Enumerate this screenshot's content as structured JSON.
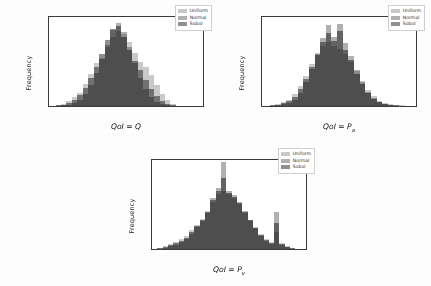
{
  "figure": {
    "background": "#fdfdfd",
    "panel_count": 3,
    "legend_entries": [
      "Uniform",
      "Normal",
      "Sobol"
    ],
    "series_colors": {
      "Uniform": "#c9c9c9",
      "Normal": "#b0b0b0",
      "Sobol": "#8f8f8f"
    },
    "shared_ylabel": "Frequency"
  },
  "chart_data": [
    {
      "id": "panel-1",
      "type": "bar",
      "title": "",
      "xlabel": "QoI = Q",
      "xlabel_base": "QoI = Q",
      "xlabel_sub": "",
      "ylabel": "Frequency",
      "xlim": [
        -37.5,
        187.5
      ],
      "ylim": [
        0,
        145
      ],
      "xticks": [
        -25,
        0,
        25,
        50,
        75,
        100,
        125,
        150,
        175
      ],
      "xticklabels": [
        "-25",
        "0",
        "25",
        "50",
        "75",
        "100",
        "125",
        "150",
        "175"
      ],
      "yticks": [
        0,
        20,
        40,
        60,
        80,
        100,
        120,
        140
      ],
      "yticklabels": [
        "0",
        "20",
        "40",
        "60",
        "80",
        "100",
        "120",
        "140"
      ],
      "grid": false,
      "legend_position": "upper right",
      "bin_width": 8,
      "bin_starts": [
        -28,
        -20,
        -12,
        -4,
        4,
        12,
        20,
        28,
        36,
        44,
        52,
        60,
        68,
        76,
        84,
        92,
        100,
        108,
        116,
        124,
        132,
        140
      ],
      "series": [
        {
          "name": "Uniform",
          "values": [
            2,
            4,
            8,
            14,
            22,
            36,
            52,
            70,
            78,
            96,
            112,
            122,
            118,
            104,
            86,
            72,
            64,
            50,
            34,
            20,
            9,
            3
          ]
        },
        {
          "name": "Normal",
          "values": [
            0,
            1,
            2,
            5,
            10,
            20,
            34,
            54,
            76,
            100,
            124,
            136,
            120,
            96,
            70,
            46,
            28,
            15,
            7,
            3,
            1,
            0
          ]
        },
        {
          "name": "Sobol",
          "values": [
            1,
            2,
            5,
            10,
            18,
            30,
            46,
            64,
            84,
            108,
            126,
            130,
            112,
            92,
            74,
            58,
            42,
            28,
            16,
            8,
            3,
            1
          ]
        }
      ]
    },
    {
      "id": "panel-2",
      "type": "bar",
      "title": "",
      "xlabel": "QoI = Pa",
      "xlabel_base": "QoI = P",
      "xlabel_sub": "a",
      "ylabel": "Frequency",
      "xlim": [
        2.3,
        3.12
      ],
      "ylim": [
        0,
        165
      ],
      "xticks": [
        2.3,
        2.4,
        2.5,
        2.6,
        2.7,
        2.8,
        2.9,
        3.0,
        3.1
      ],
      "xticklabels": [
        "2.3",
        "2.4",
        "2.5",
        "2.6",
        "2.7",
        "2.8",
        "2.9",
        "3.0",
        "3.1"
      ],
      "yticks": [
        0,
        20,
        40,
        60,
        80,
        100,
        120,
        140,
        160
      ],
      "yticklabels": [
        "0",
        "20",
        "40",
        "60",
        "80",
        "100",
        "120",
        "140",
        "160"
      ],
      "grid": false,
      "legend_position": "upper right",
      "bin_width": 0.03,
      "bin_starts": [
        2.34,
        2.37,
        2.4,
        2.43,
        2.46,
        2.49,
        2.52,
        2.55,
        2.58,
        2.61,
        2.64,
        2.67,
        2.7,
        2.73,
        2.76,
        2.79,
        2.82,
        2.85,
        2.88,
        2.91,
        2.94,
        2.97,
        3.0,
        3.03
      ],
      "series": [
        {
          "name": "Uniform",
          "values": [
            2,
            4,
            7,
            12,
            22,
            38,
            56,
            78,
            98,
            112,
            118,
            112,
            106,
            96,
            82,
            64,
            46,
            30,
            18,
            10,
            6,
            3,
            2,
            1
          ]
        },
        {
          "name": "Normal",
          "values": [
            0,
            1,
            3,
            6,
            12,
            24,
            44,
            68,
            96,
            126,
            150,
            128,
            152,
            116,
            92,
            66,
            44,
            26,
            14,
            7,
            3,
            1,
            0,
            0
          ]
        },
        {
          "name": "Sobol",
          "values": [
            1,
            2,
            5,
            9,
            17,
            32,
            50,
            72,
            94,
            118,
            136,
            120,
            140,
            104,
            86,
            60,
            40,
            24,
            13,
            7,
            4,
            2,
            1,
            0
          ]
        }
      ]
    },
    {
      "id": "panel-3",
      "type": "bar",
      "title": "",
      "xlabel": "QoI = Pv",
      "xlabel_base": "QoI = P",
      "xlabel_sub": "v",
      "ylabel": "Frequency",
      "xlim": [
        -1.25,
        1.65
      ],
      "ylim": [
        0,
        182
      ],
      "xticks": [
        -1.0,
        -0.5,
        0.0,
        0.5,
        1.0,
        1.5
      ],
      "xticklabels": [
        "-1.0",
        "-0.5",
        "0.0",
        "0.5",
        "1.0",
        "1.5"
      ],
      "yticks": [
        0,
        25,
        50,
        75,
        100,
        125,
        150,
        175
      ],
      "yticklabels": [
        "0",
        "25",
        "50",
        "75",
        "100",
        "125",
        "150",
        "175"
      ],
      "grid": false,
      "legend_position": "upper right",
      "bin_width": 0.1,
      "bin_starts": [
        -1.15,
        -1.05,
        -0.95,
        -0.85,
        -0.75,
        -0.65,
        -0.55,
        -0.45,
        -0.35,
        -0.25,
        -0.15,
        -0.05,
        0.05,
        0.15,
        0.25,
        0.35,
        0.45,
        0.55,
        0.65,
        0.75,
        0.85,
        0.95,
        1.05,
        1.15,
        1.25,
        1.35
      ],
      "series": [
        {
          "name": "Uniform",
          "values": [
            3,
            6,
            10,
            14,
            20,
            26,
            38,
            50,
            62,
            78,
            96,
            112,
            118,
            112,
            104,
            92,
            74,
            58,
            44,
            30,
            20,
            14,
            34,
            12,
            6,
            2
          ]
        },
        {
          "name": "Normal",
          "values": [
            1,
            3,
            6,
            9,
            14,
            20,
            30,
            44,
            58,
            74,
            104,
            124,
            178,
            118,
            110,
            96,
            78,
            60,
            42,
            26,
            16,
            10,
            76,
            8,
            4,
            1
          ]
        },
        {
          "name": "Sobol",
          "values": [
            2,
            4,
            8,
            12,
            17,
            23,
            34,
            47,
            60,
            76,
            100,
            118,
            146,
            115,
            107,
            94,
            76,
            59,
            43,
            28,
            18,
            12,
            54,
            10,
            5,
            2
          ]
        }
      ]
    }
  ]
}
